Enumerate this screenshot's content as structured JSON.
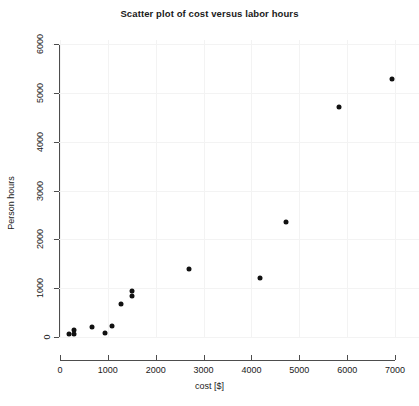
{
  "chart_data": {
    "type": "scatter",
    "title": "Scatter plot of cost versus labor hours",
    "xlabel": "cost [$]",
    "ylabel": "Person hours",
    "xlim": [
      0,
      7000
    ],
    "ylim": [
      0,
      6000
    ],
    "xticks": [
      0,
      1000,
      2000,
      3000,
      4000,
      5000,
      6000,
      7000
    ],
    "yticks": [
      0,
      1000,
      2000,
      3000,
      4000,
      5000,
      6000
    ],
    "xtick_labels": [
      "0",
      "1000",
      "2000",
      "3000",
      "4000",
      "5000",
      "6000",
      "7000"
    ],
    "ytick_labels": [
      "0",
      "1000",
      "2000",
      "3000",
      "4000",
      "5000",
      "6000"
    ],
    "grid": true,
    "legend": null,
    "marker": "filled-circle",
    "marker_color": "#111111",
    "points": [
      {
        "x": 180,
        "y": 60
      },
      {
        "x": 300,
        "y": 150
      },
      {
        "x": 300,
        "y": 60
      },
      {
        "x": 660,
        "y": 210
      },
      {
        "x": 950,
        "y": 80
      },
      {
        "x": 1090,
        "y": 230
      },
      {
        "x": 1280,
        "y": 670
      },
      {
        "x": 1500,
        "y": 840
      },
      {
        "x": 1510,
        "y": 950
      },
      {
        "x": 2700,
        "y": 1390
      },
      {
        "x": 4180,
        "y": 1200
      },
      {
        "x": 4730,
        "y": 2350
      },
      {
        "x": 5820,
        "y": 4700
      },
      {
        "x": 6930,
        "y": 5290
      }
    ]
  },
  "colors": {
    "background": "#ffffff",
    "axis": "#4d4d4d",
    "grid": "#f3f3f3",
    "text": "#1a1a1a",
    "marker": "#111111"
  }
}
